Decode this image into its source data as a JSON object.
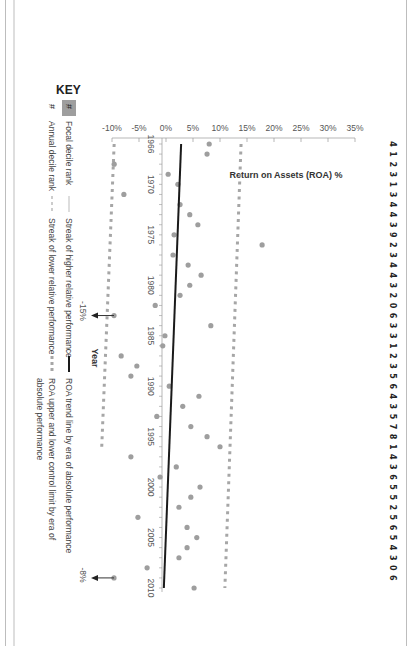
{
  "chart_data": {
    "type": "scatter",
    "title": "",
    "xlabel": "Year",
    "ylabel": "Return on Assets (ROA) %",
    "orientation_note": "figure rotated 90 degrees clockwise",
    "xlim": [
      1966,
      2010
    ],
    "ylim": [
      -10,
      35
    ],
    "x_ticks": [
      "1966",
      "1970",
      "1975",
      "1980",
      "1985",
      "1990",
      "1995",
      "2000",
      "2005",
      "2010"
    ],
    "y_ticks": [
      "35%",
      "30%",
      "25%",
      "20%",
      "15%",
      "10%",
      "5%",
      "0%",
      "-5%",
      "-10%"
    ],
    "series": [
      {
        "name": "Annual ROA",
        "x": [
          1966,
          1967,
          1968,
          1969,
          1970,
          1971,
          1972,
          1973,
          1974,
          1975,
          1976,
          1977,
          1978,
          1979,
          1980,
          1981,
          1982,
          1983,
          1984,
          1985,
          1986,
          1987,
          1988,
          1989,
          1990,
          1991,
          1992,
          1993,
          1994,
          1995,
          1996,
          1997,
          1998,
          1999,
          2000,
          2001,
          2002,
          2003,
          2004,
          2005,
          2006,
          2007,
          2008,
          2009,
          2010
        ],
        "values": [
          8.0,
          7.6,
          -9.6,
          0.4,
          2.2,
          -7.8,
          2.6,
          4.4,
          5.9,
          1.5,
          17.8,
          1.3,
          4.1,
          6.5,
          4.4,
          2.6,
          -2.0,
          -15,
          8.3,
          -0.2,
          -0.6,
          -8.3,
          -5.4,
          -6.5,
          0.6,
          6.1,
          3.1,
          -1.7,
          4.6,
          7.6,
          10.0,
          -6.5,
          1.9,
          -1.1,
          6.3,
          4.6,
          2.4,
          -5.2,
          3.9,
          5.7,
          3.9,
          2.4,
          -3.5,
          -8,
          5.2
        ]
      },
      {
        "name": "ROA trend line by era of absolute performance",
        "x": [
          1966,
          2010
        ],
        "values": [
          2.8,
          -0.4
        ]
      },
      {
        "name": "ROA upper control limit",
        "x": [
          1966,
          2010
        ],
        "values": [
          13.9,
          10.9
        ]
      },
      {
        "name": "ROA lower control limit",
        "x": [
          1966,
          1996
        ],
        "values": [
          -9.6,
          -11.9
        ]
      }
    ],
    "annotations": [
      {
        "year": 1983,
        "label": "-15%",
        "note": "off-scale value, arrow"
      },
      {
        "year": 2009,
        "label": "-8%",
        "note": "off-scale value, arrow"
      }
    ],
    "annual_decile_ranks": "4 1 2 3 1 3 4 4 3 9 2 3 4 4 3 2 0 6 3 3 1 2 3 5 6 4 3 5 7 8 1 4 3 6 5 5 2 5 6 5 4 3 0 6",
    "legend": {
      "title": "KEY",
      "items": [
        "Focal decile rank",
        "Annual decile rank",
        "Streak of higher relative performance",
        "Streak of lower relative performance",
        "ROA trend line by era of absolute performance",
        "ROA upper and lower control limit by era of absolute performance"
      ]
    },
    "grid": false
  },
  "ranks": {
    "digits": [
      "4",
      "1",
      "2",
      "3",
      "1",
      "3",
      "4",
      "4",
      "3",
      "9",
      "2",
      "3",
      "4",
      "4",
      "3",
      "2",
      "0",
      "6",
      "3",
      "3",
      "1",
      "2",
      "3",
      "5",
      "6",
      "4",
      "3",
      "5",
      "7",
      "8",
      "1",
      "4",
      "3",
      "6",
      "5",
      "5",
      "2",
      "5",
      "6",
      "5",
      "4",
      "3",
      "0",
      "6"
    ]
  },
  "axis": {
    "ylabel": "Return on Assets (ROA) %",
    "xlabel": "Year",
    "y_ticks": [
      "35%",
      "30%",
      "25%",
      "20%",
      "15%",
      "10%",
      "5%",
      "0%",
      "-5%",
      "-10%"
    ],
    "x_ticks": [
      "1966",
      "1970",
      "1975",
      "1980",
      "1985",
      "1990",
      "1995",
      "2000",
      "2005",
      "2010"
    ]
  },
  "annotations": {
    "a1983": "-15%",
    "a2009": "-8%"
  },
  "key": {
    "title": "KEY",
    "focal_symbol": "#",
    "focal_label": "Focal decile rank",
    "annual_symbol": "#",
    "annual_label": "Annual decile rank",
    "higher_label": "Streak of higher relative performance",
    "lower_label": "Streak of lower relative performance",
    "trend_label": "ROA trend line by era of absolute performance",
    "control_label_1": "ROA upper and lower control limit by era of",
    "control_label_2": "absolute performance"
  },
  "colors": {
    "point": "#9e9e9e",
    "trend": "#1a1a1a",
    "control": "#a6a6a6",
    "focal_box": "#9e9e9e"
  }
}
